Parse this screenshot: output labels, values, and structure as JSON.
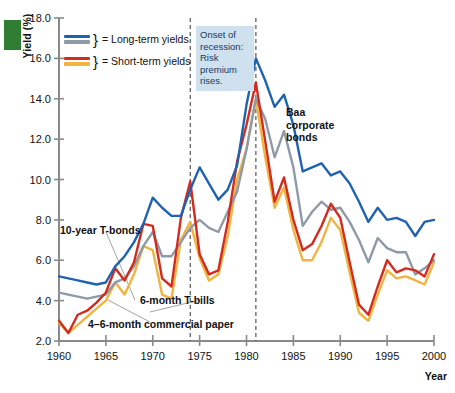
{
  "axes": {
    "y_title": "Yield (%)",
    "x_title": "Year",
    "y_ticks": [
      "18.0",
      "16.0",
      "14.0",
      "12.0",
      "10.0",
      "8.0",
      "6.0",
      "4.0",
      "2.0"
    ],
    "x_ticks": [
      "1960",
      "1965",
      "1970",
      "1975",
      "1980",
      "1985",
      "1990",
      "1995",
      "2000"
    ]
  },
  "legend": {
    "items": [
      {
        "label": "= Long-term yields",
        "colors": [
          "#1f63b0",
          "#8f9aa8"
        ]
      },
      {
        "label": "= Short-term yields",
        "colors": [
          "#d32b1e",
          "#f0b440"
        ]
      }
    ],
    "brace": "}"
  },
  "annotation": {
    "text": "Onset of recession: Risk premium rises.",
    "background": "#cfe0ef",
    "text_color": "#1a3a5c"
  },
  "series_labels": {
    "baa": "Baa corporate bonds",
    "tbonds": "10-year T-bonds",
    "tbills": "6-month T-bills",
    "commercial_paper": "4–6-month commercial paper"
  },
  "colors": {
    "baa": "#1f63b0",
    "tbonds": "#8f9aa8",
    "commercial_paper": "#d32b1e",
    "tbills": "#f0b440",
    "axis": "#8a8a8a",
    "recession_line": "#555555",
    "corner_mark": "#2e7d32"
  },
  "chart_data": {
    "type": "line",
    "title": "",
    "xlabel": "Year",
    "ylabel": "Yield (%)",
    "xlim": [
      1960,
      2000
    ],
    "ylim": [
      2.0,
      18.0
    ],
    "grid": false,
    "legend_position": "top-left",
    "x": [
      1960,
      1961,
      1962,
      1963,
      1964,
      1965,
      1966,
      1967,
      1968,
      1969,
      1970,
      1971,
      1972,
      1973,
      1974,
      1975,
      1976,
      1977,
      1978,
      1979,
      1980,
      1981,
      1982,
      1983,
      1984,
      1985,
      1986,
      1987,
      1988,
      1989,
      1990,
      1991,
      1992,
      1993,
      1994,
      1995,
      1996,
      1997,
      1998,
      1999,
      2000
    ],
    "annotations": [
      {
        "text": "Onset of recession: Risk premium rises.",
        "x": 1974,
        "y": 17.0
      },
      {
        "text": "Baa corporate bonds",
        "x": 1986,
        "y": 12.6
      },
      {
        "text": "10-year T-bonds",
        "x": 1962,
        "y": 7.3
      },
      {
        "text": "6-month T-bills",
        "x": 1969,
        "y": 3.7
      },
      {
        "text": "4–6-month commercial paper",
        "x": 1964,
        "y": 2.8
      }
    ],
    "vertical_markers": [
      {
        "x": 1974,
        "style": "dashed"
      },
      {
        "x": 1981,
        "style": "dashed"
      }
    ],
    "series": [
      {
        "name": "Baa corporate bonds",
        "color": "#1f63b0",
        "group": "long-term",
        "values": [
          5.2,
          5.1,
          5.0,
          4.9,
          4.8,
          4.9,
          5.7,
          6.2,
          6.9,
          7.8,
          9.1,
          8.6,
          8.2,
          8.2,
          9.5,
          10.6,
          9.8,
          9.0,
          9.5,
          10.7,
          13.7,
          16.0,
          14.9,
          13.6,
          14.2,
          12.7,
          10.4,
          10.6,
          10.8,
          10.2,
          10.4,
          9.8,
          8.9,
          7.9,
          8.6,
          8.0,
          8.1,
          7.9,
          7.2,
          7.9,
          8.0
        ]
      },
      {
        "name": "10-year T-bonds",
        "color": "#8f9aa8",
        "group": "long-term",
        "values": [
          4.4,
          4.3,
          4.2,
          4.1,
          4.2,
          4.3,
          4.9,
          5.1,
          5.7,
          6.7,
          7.4,
          6.2,
          6.2,
          6.9,
          7.6,
          8.0,
          7.6,
          7.4,
          8.4,
          9.4,
          11.5,
          14.0,
          13.0,
          11.1,
          12.4,
          10.6,
          7.7,
          8.4,
          8.9,
          8.5,
          8.6,
          7.9,
          7.0,
          5.9,
          7.1,
          6.6,
          6.4,
          6.4,
          5.3,
          5.6,
          6.0
        ]
      },
      {
        "name": "4–6-month commercial paper",
        "color": "#d32b1e",
        "group": "short-term",
        "values": [
          3.0,
          2.4,
          3.3,
          3.5,
          3.9,
          4.4,
          5.6,
          5.0,
          5.9,
          7.8,
          7.7,
          5.1,
          4.7,
          8.1,
          9.9,
          6.3,
          5.3,
          5.5,
          7.9,
          10.9,
          12.7,
          14.8,
          11.9,
          8.9,
          10.1,
          8.0,
          6.5,
          6.8,
          7.7,
          8.8,
          8.1,
          5.9,
          3.8,
          3.3,
          4.7,
          6.0,
          5.4,
          5.6,
          5.5,
          5.2,
          6.3
        ]
      },
      {
        "name": "6-month T-bills",
        "color": "#f0b440",
        "group": "short-term",
        "values": [
          2.9,
          2.4,
          2.8,
          3.2,
          3.6,
          4.0,
          4.9,
          4.3,
          5.3,
          6.7,
          6.5,
          4.3,
          4.1,
          7.0,
          7.9,
          6.1,
          5.0,
          5.3,
          7.2,
          10.0,
          11.5,
          14.0,
          11.1,
          8.6,
          9.6,
          7.5,
          6.0,
          6.0,
          6.9,
          8.1,
          7.5,
          5.4,
          3.4,
          3.0,
          4.3,
          5.5,
          5.1,
          5.2,
          5.0,
          4.8,
          5.9
        ]
      }
    ]
  }
}
